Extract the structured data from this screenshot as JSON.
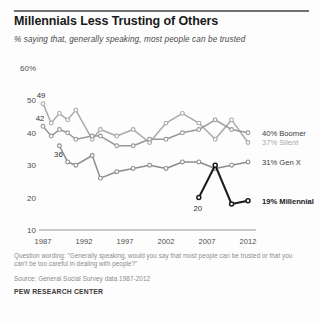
{
  "header": {
    "title": "Millennials Less Trusting of Others",
    "subtitle": "% saying that, generally speaking, most people can be trusted"
  },
  "footer": {
    "note": "Question wording: \"Generally speaking, would you say that most people can be trusted or that you can't be too careful in dealing with people?\"",
    "source": "Source: General Social Survey data 1987-2012",
    "brand": "PEW RESEARCH CENTER"
  },
  "chart_data": {
    "type": "line",
    "title": "Millennials Less Trusting of Others",
    "subtitle": "% saying that, generally speaking, most people can be trusted",
    "xlabel": "",
    "ylabel": "",
    "xlim": [
      1987,
      2012
    ],
    "ylim": [
      10,
      60
    ],
    "ytick_labels": [
      "60%",
      "50",
      "40",
      "30",
      "20",
      "10"
    ],
    "yticks": [
      60,
      50,
      40,
      30,
      20,
      10
    ],
    "xtick_labels": [
      "1987",
      "1992",
      "1997",
      "2002",
      "2007",
      "2012"
    ],
    "xticks": [
      1987,
      1992,
      1997,
      2002,
      2007,
      2012
    ],
    "grid": false,
    "legend_position": "right-inline",
    "series": [
      {
        "name": "Silent",
        "color": "#a9a9a9",
        "end_label": "37% Silent",
        "start_label": "49",
        "x": [
          1987,
          1988,
          1989,
          1990,
          1991,
          1993,
          1994,
          1996,
          1998,
          2000,
          2002,
          2004,
          2006,
          2008,
          2010,
          2012
        ],
        "values": [
          49,
          43,
          46,
          44,
          47,
          38,
          41,
          39,
          41,
          37,
          43,
          46,
          43,
          38,
          44,
          37
        ]
      },
      {
        "name": "Boomer",
        "color": "#999999",
        "end_label": "40% Boomer",
        "start_label": "42",
        "x": [
          1987,
          1988,
          1989,
          1990,
          1991,
          1993,
          1994,
          1996,
          1998,
          2000,
          2002,
          2004,
          2006,
          2008,
          2010,
          2012
        ],
        "values": [
          42,
          39,
          41,
          40,
          38,
          39,
          39,
          36,
          36,
          38,
          38,
          40,
          41,
          44,
          41,
          40
        ]
      },
      {
        "name": "Gen X",
        "color": "#8c8c8c",
        "end_label": "31% Gen X",
        "start_label": "36",
        "x": [
          1989,
          1990,
          1991,
          1993,
          1994,
          1996,
          1998,
          2000,
          2002,
          2004,
          2006,
          2008,
          2010,
          2012
        ],
        "values": [
          36,
          31,
          30,
          33,
          26,
          28,
          29,
          30,
          29,
          31,
          31,
          29,
          30,
          31
        ]
      },
      {
        "name": "Millennial",
        "color": "#1a1a1a",
        "end_label": "19% Millennial",
        "start_label": "20",
        "x": [
          2006,
          2008,
          2010,
          2012
        ],
        "values": [
          20,
          30,
          18,
          19
        ]
      }
    ],
    "annotations": [
      {
        "text": "49",
        "series": "Silent",
        "x": 1987,
        "y": 49
      },
      {
        "text": "42",
        "series": "Boomer",
        "x": 1987,
        "y": 42
      },
      {
        "text": "36",
        "series": "Gen X",
        "x": 1989,
        "y": 36
      },
      {
        "text": "20",
        "series": "Millennial",
        "x": 2006,
        "y": 20
      }
    ]
  }
}
